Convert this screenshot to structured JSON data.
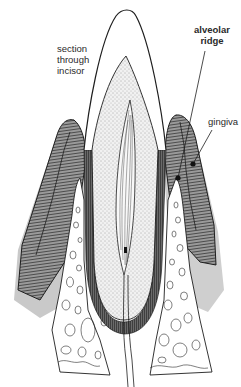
{
  "diagram": {
    "labels": {
      "section": "section\nthrough\nincisor",
      "alveolar_ridge": "alveolar\nridge",
      "gingiva": "gingiva"
    },
    "colors": {
      "ink": "#1e1e1e",
      "gum_fill": "#8a8a8a",
      "gum_shadow": "#c8c8c8",
      "dentine_fill": "#e9e9e9",
      "background": "#ffffff"
    }
  }
}
